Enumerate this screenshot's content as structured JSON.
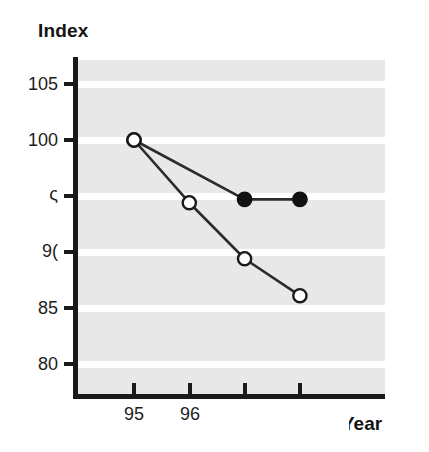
{
  "chart_data": {
    "type": "line",
    "title": "",
    "xlabel": "Year",
    "xlabel_rendered": "rear",
    "ylabel": "Index",
    "xlim": [
      94.5,
      98.5
    ],
    "ylim": [
      77.5,
      106.8
    ],
    "grid": true,
    "legend": "none",
    "x": [
      95,
      96,
      97,
      98
    ],
    "x_tick_labels": [
      "95",
      "96",
      "",
      ""
    ],
    "y_ticks": [
      105,
      100,
      95,
      90,
      85,
      80
    ],
    "y_tick_labels": [
      "105",
      "100",
      "95",
      "90",
      "85",
      "80"
    ],
    "y_tick_labels_rendered": [
      "105",
      "100",
      "ς",
      "9(",
      "85",
      "80"
    ],
    "series": [
      {
        "name": "series-filled",
        "marker": "filled-circle",
        "x": [
          95,
          97,
          98
        ],
        "values": [
          100.0,
          94.7,
          94.7
        ]
      },
      {
        "name": "series-open",
        "marker": "open-circle",
        "x": [
          95,
          96,
          97,
          98
        ],
        "values": [
          100.0,
          94.4,
          89.4,
          86.1
        ]
      }
    ],
    "colors": {
      "plot_background": "#e8e8e8",
      "gridline": "#ffffff",
      "axis": "#1a1a1a",
      "line": "#2b2b2b",
      "marker_filled": "#121212",
      "marker_open_fill": "#ffffff",
      "page_background": "#ffffff"
    }
  }
}
